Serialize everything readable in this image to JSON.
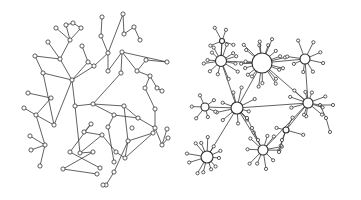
{
  "figure": {
    "panels": [
      {
        "id": "random-network",
        "nodes": [
          [
            66,
            25
          ],
          [
            73,
            23
          ],
          [
            56,
            28
          ],
          [
            81,
            28
          ],
          [
            70,
            40
          ],
          [
            48,
            42
          ],
          [
            60,
            59
          ],
          [
            35,
            56
          ],
          [
            43,
            73
          ],
          [
            72,
            80
          ],
          [
            82,
            46
          ],
          [
            88,
            62
          ],
          [
            94,
            66
          ],
          [
            102,
            17
          ],
          [
            101,
            36
          ],
          [
            108,
            53
          ],
          [
            123,
            14
          ],
          [
            124,
            34
          ],
          [
            134,
            27
          ],
          [
            140,
            40
          ],
          [
            108,
            71
          ],
          [
            122,
            52
          ],
          [
            121,
            73
          ],
          [
            137,
            71
          ],
          [
            146,
            60
          ],
          [
            167,
            62
          ],
          [
            150,
            76
          ],
          [
            157,
            88
          ],
          [
            162,
            91
          ],
          [
            145,
            88
          ],
          [
            155,
            109
          ],
          [
            28,
            93
          ],
          [
            51,
            98
          ],
          [
            36,
            115
          ],
          [
            24,
            108
          ],
          [
            75,
            106
          ],
          [
            93,
            104
          ],
          [
            114,
            115
          ],
          [
            108,
            127
          ],
          [
            132,
            128
          ],
          [
            124,
            106
          ],
          [
            128,
            141
          ],
          [
            153,
            133
          ],
          [
            125,
            158
          ],
          [
            116,
            152
          ],
          [
            102,
            135
          ],
          [
            84,
            132
          ],
          [
            91,
            124
          ],
          [
            70,
            152
          ],
          [
            100,
            168
          ],
          [
            80,
            153
          ],
          [
            93,
            152
          ],
          [
            63,
            169
          ],
          [
            97,
            174
          ],
          [
            40,
            166
          ],
          [
            45,
            145
          ],
          [
            31,
            150
          ],
          [
            30,
            136
          ],
          [
            54,
            125
          ],
          [
            138,
            118
          ],
          [
            155,
            128
          ],
          [
            162,
            145
          ],
          [
            168,
            138
          ],
          [
            167,
            129
          ],
          [
            114,
            172
          ],
          [
            106,
            185
          ],
          [
            114,
            162
          ],
          [
            103,
            185
          ]
        ],
        "edges": [
          [
            0,
            1
          ],
          [
            1,
            3
          ],
          [
            0,
            4
          ],
          [
            2,
            4
          ],
          [
            3,
            4
          ],
          [
            4,
            6
          ],
          [
            5,
            6
          ],
          [
            6,
            7
          ],
          [
            7,
            8
          ],
          [
            6,
            9
          ],
          [
            8,
            9
          ],
          [
            9,
            11
          ],
          [
            10,
            11
          ],
          [
            11,
            12
          ],
          [
            12,
            15
          ],
          [
            13,
            14
          ],
          [
            14,
            15
          ],
          [
            15,
            16
          ],
          [
            16,
            17
          ],
          [
            17,
            18
          ],
          [
            18,
            19
          ],
          [
            15,
            20
          ],
          [
            20,
            21
          ],
          [
            21,
            22
          ],
          [
            21,
            23
          ],
          [
            23,
            24
          ],
          [
            24,
            25
          ],
          [
            23,
            26
          ],
          [
            26,
            27
          ],
          [
            26,
            29
          ],
          [
            27,
            28
          ],
          [
            9,
            35
          ],
          [
            35,
            36
          ],
          [
            36,
            37
          ],
          [
            37,
            38
          ],
          [
            36,
            40
          ],
          [
            40,
            41
          ],
          [
            41,
            42
          ],
          [
            41,
            43
          ],
          [
            43,
            44
          ],
          [
            44,
            45
          ],
          [
            45,
            46
          ],
          [
            46,
            47
          ],
          [
            47,
            48
          ],
          [
            48,
            49
          ],
          [
            35,
            50
          ],
          [
            50,
            51
          ],
          [
            51,
            52
          ],
          [
            52,
            53
          ],
          [
            33,
            34
          ],
          [
            32,
            33
          ],
          [
            31,
            32
          ],
          [
            33,
            55
          ],
          [
            55,
            56
          ],
          [
            55,
            57
          ],
          [
            55,
            54
          ],
          [
            9,
            58
          ],
          [
            58,
            33
          ],
          [
            40,
            59
          ],
          [
            59,
            60
          ],
          [
            60,
            61
          ],
          [
            61,
            62
          ],
          [
            61,
            63
          ],
          [
            60,
            42
          ],
          [
            41,
            64
          ],
          [
            64,
            65
          ],
          [
            38,
            66
          ],
          [
            42,
            43
          ],
          [
            30,
            60
          ],
          [
            22,
            36
          ],
          [
            12,
            9
          ],
          [
            8,
            58
          ],
          [
            21,
            25
          ],
          [
            29,
            30
          ],
          [
            37,
            59
          ],
          [
            45,
            50
          ]
        ]
      },
      {
        "id": "scale-free-network",
        "hubs": [
          {
            "name": "hub-central",
            "x": 262,
            "y": 63,
            "r": 10
          },
          {
            "name": "hub-upper-left",
            "x": 221,
            "y": 61,
            "r": 5.5
          },
          {
            "name": "hub-upper-right",
            "x": 305,
            "y": 59,
            "r": 5
          },
          {
            "name": "hub-middle",
            "x": 237,
            "y": 108,
            "r": 6
          },
          {
            "name": "hub-right",
            "x": 308,
            "y": 103,
            "r": 5
          },
          {
            "name": "hub-left",
            "x": 205,
            "y": 107,
            "r": 4
          },
          {
            "name": "hub-lower-left",
            "x": 207,
            "y": 157,
            "r": 6
          },
          {
            "name": "hub-lower-middle",
            "x": 263,
            "y": 150,
            "r": 5
          },
          {
            "name": "hub-small",
            "x": 286,
            "y": 130,
            "r": 3
          },
          {
            "name": "hub-top",
            "x": 222,
            "y": 41,
            "r": 2.5
          }
        ],
        "hub_links": [
          [
            0,
            1
          ],
          [
            0,
            2
          ],
          [
            0,
            3
          ],
          [
            0,
            4
          ],
          [
            1,
            3
          ],
          [
            2,
            4
          ],
          [
            3,
            4
          ],
          [
            3,
            5
          ],
          [
            3,
            6
          ],
          [
            3,
            7
          ],
          [
            4,
            7
          ],
          [
            4,
            8
          ],
          [
            1,
            9
          ]
        ]
      }
    ]
  }
}
